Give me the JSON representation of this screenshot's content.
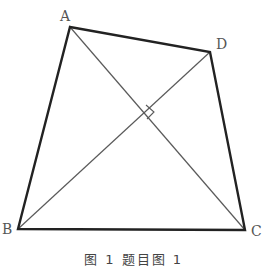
{
  "diagram": {
    "type": "quadrilateral-with-diagonals",
    "vertices": {
      "A": {
        "label": "A",
        "x": 70,
        "y": 27
      },
      "D": {
        "label": "D",
        "x": 210,
        "y": 52
      },
      "B": {
        "label": "B",
        "x": 18,
        "y": 229
      },
      "C": {
        "label": "C",
        "x": 245,
        "y": 230
      }
    },
    "diagonals": [
      "AC",
      "BD"
    ],
    "right_angle_marker": {
      "at": "intersection of AC and BD",
      "x": 146,
      "y": 113
    },
    "caption": "图 1 题目图 1",
    "colors": {
      "edge": "#222222",
      "diagonal": "#555555",
      "label": "#555555"
    }
  }
}
